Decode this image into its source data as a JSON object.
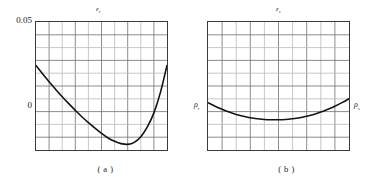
{
  "figure": {
    "panels": [
      {
        "id": "a",
        "caption": "( a )",
        "top_symbol": "ε",
        "top_symbol_sub": "r",
        "y_tick_top": "0.05",
        "y_tick_bottom": "0"
      },
      {
        "id": "b",
        "caption": "( b )",
        "top_symbol": "ε",
        "top_symbol_sub": "s",
        "left_symbol": "ρ",
        "left_symbol_sub": "r",
        "right_symbol": "ρ",
        "right_symbol_sub": "s"
      }
    ]
  },
  "chart_data": [
    {
      "type": "line",
      "id": "panel-a",
      "title": "εr",
      "xlabel": "",
      "ylabel": "εr",
      "ylim": [
        0,
        0.05
      ],
      "xlim": [
        0,
        1
      ],
      "grid": true,
      "grid_columns": 10,
      "grid_rows": 10,
      "legend": "none",
      "annotations": [
        "( a )"
      ],
      "tick_labels_y": [
        "0.05",
        "0"
      ],
      "series": [
        {
          "name": "strain-r",
          "x": [
            0.0,
            0.05,
            0.1,
            0.15,
            0.2,
            0.25,
            0.3,
            0.35,
            0.4,
            0.45,
            0.5,
            0.55,
            0.6,
            0.65,
            0.7,
            0.75,
            0.8,
            0.85,
            0.9,
            0.95,
            1.0
          ],
          "y": [
            0.033,
            0.0298,
            0.0267,
            0.0237,
            0.0208,
            0.0181,
            0.0155,
            0.013,
            0.0107,
            0.0085,
            0.0065,
            0.0047,
            0.0034,
            0.0025,
            0.0022,
            0.003,
            0.0052,
            0.009,
            0.0145,
            0.0225,
            0.033
          ]
        }
      ]
    },
    {
      "type": "line",
      "id": "panel-b",
      "title": "εs",
      "xlabel": "",
      "ylabel": "εs",
      "ylim": [
        0,
        0.05
      ],
      "xlim": [
        0,
        1
      ],
      "grid": true,
      "grid_columns": 10,
      "grid_rows": 10,
      "legend": "none",
      "annotations": [
        "( b )",
        "ρr",
        "ρs"
      ],
      "tick_labels_y": [],
      "series": [
        {
          "name": "strain-s",
          "x": [
            0.0,
            0.05,
            0.1,
            0.15,
            0.2,
            0.25,
            0.3,
            0.35,
            0.4,
            0.45,
            0.5,
            0.55,
            0.6,
            0.65,
            0.7,
            0.75,
            0.8,
            0.85,
            0.9,
            0.95,
            1.0
          ],
          "y": [
            0.0185,
            0.0171,
            0.0159,
            0.0148,
            0.0139,
            0.0132,
            0.0126,
            0.0122,
            0.0119,
            0.0118,
            0.0118,
            0.0119,
            0.0122,
            0.0126,
            0.0132,
            0.0139,
            0.0148,
            0.0159,
            0.0171,
            0.0185,
            0.02
          ]
        }
      ]
    }
  ]
}
